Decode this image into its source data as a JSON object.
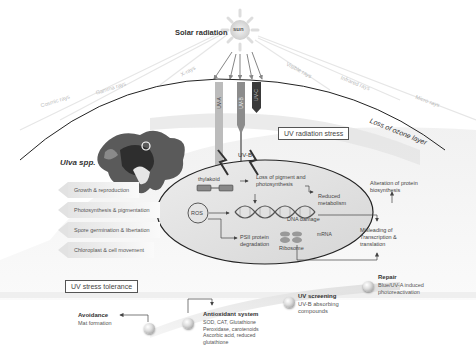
{
  "header": {
    "title": "Solar radiation",
    "sun_label": "sun"
  },
  "rays": [
    {
      "label": "Cosmic rays"
    },
    {
      "label": "Gamma rays"
    },
    {
      "label": "X-rays"
    },
    {
      "label": "Visible rays"
    },
    {
      "label": "Infrared rays"
    },
    {
      "label": "Micro rays"
    }
  ],
  "uv_bands": [
    {
      "label": "UV-A",
      "color": "#b8b8b8"
    },
    {
      "label": "UV-B",
      "color": "#8a8a8a"
    },
    {
      "label": "UV-C",
      "color": "#333333"
    }
  ],
  "atmosphere": {
    "ozone_label": "Loss of ozone layer"
  },
  "organism": {
    "name": "Ulva spp.",
    "effects": [
      {
        "label": "Growth & reproduction"
      },
      {
        "label": "Photosynthesis & pigmentation"
      },
      {
        "label": "Spore germination & libertation"
      },
      {
        "label": "Chloroplast & cell movement"
      }
    ]
  },
  "stress": {
    "title": "UV radiation stress",
    "uvb_label": "UV-B",
    "cell": {
      "thylakoid": "thylakoid",
      "pigment_loss": "Loss of pigment and photosynthesis",
      "reduced_metabolism": "Reduced metabolism",
      "ros": "ROS",
      "dna_damage": "DNA damage",
      "mrna": "mRNA",
      "psii": "PSII protein degradation",
      "ribosome": "Ribosome"
    },
    "outside": {
      "alteration": "Alteration of protein biosynthesis",
      "misleading": "Misleading of Transcription & translation"
    }
  },
  "tolerance": {
    "title": "UV stress tolerance",
    "steps": [
      {
        "title": "Avoidance",
        "detail": "Mat formation"
      },
      {
        "title": "Antioxidant system",
        "detail": "SOD, CAT, Glutathione Peroxidase, carotenoids Ascorbic acid, reduced glutathione"
      },
      {
        "title": "UV screening",
        "detail": "UV-B absorbing compounds"
      },
      {
        "title": "Repair",
        "detail": "Blue/UV-A induced photoreactivation"
      }
    ]
  }
}
